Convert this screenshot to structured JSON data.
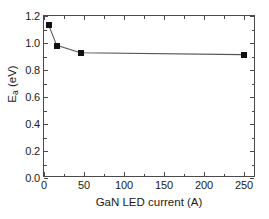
{
  "chart_data": {
    "type": "line",
    "title": "",
    "xlabel": "GaN LED current (A)",
    "ylabel": "Ea (eV)",
    "ylabel_base": "E",
    "ylabel_sub": "a",
    "ylabel_unit": " (eV)",
    "xlim": [
      0,
      265
    ],
    "ylim": [
      0.0,
      1.2
    ],
    "grid": false,
    "legend": false,
    "marker": "filled-square",
    "line_color": "#555555",
    "marker_color": "#111111",
    "x": [
      6,
      16,
      46,
      250
    ],
    "y": [
      1.13,
      0.98,
      0.925,
      0.91
    ],
    "series": [
      {
        "name": "Ea vs GaN LED current",
        "points": [
          {
            "x": 6,
            "y": 1.13
          },
          {
            "x": 16,
            "y": 0.98
          },
          {
            "x": 46,
            "y": 0.925
          },
          {
            "x": 250,
            "y": 0.91
          }
        ]
      }
    ],
    "xticks": [
      0,
      50,
      100,
      150,
      200,
      250
    ],
    "xtick_labels": [
      "0",
      "50",
      "100",
      "150",
      "200",
      "250"
    ],
    "xticks_minor": [
      25,
      75,
      125,
      175,
      225
    ],
    "yticks": [
      0.0,
      0.2,
      0.4,
      0.6,
      0.8,
      1.0,
      1.2
    ],
    "ytick_labels": [
      "0.0",
      "0.2",
      "0.4",
      "0.6",
      "0.8",
      "1.0",
      "1.2"
    ],
    "yticks_minor": [
      0.1,
      0.3,
      0.5,
      0.7,
      0.9,
      1.1
    ]
  },
  "colors": {
    "background": "#ffffff",
    "axis": "#4a4a4a",
    "text": "#1a1a1a",
    "line": "#555555",
    "marker": "#111111"
  }
}
